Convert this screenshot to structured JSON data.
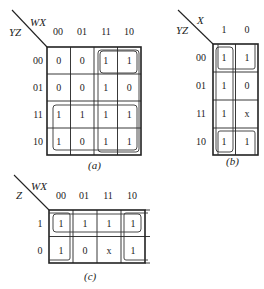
{
  "maps": {
    "a": {
      "caption": "(a)",
      "row_var": "YZ",
      "col_var": "WX",
      "col_labels": [
        "00",
        "01",
        "11",
        "10"
      ],
      "row_labels": [
        "00",
        "01",
        "11",
        "10"
      ],
      "cells": [
        [
          "0",
          "0",
          "1",
          "1"
        ],
        [
          "0",
          "0",
          "1",
          "0"
        ],
        [
          "1",
          "1",
          "1",
          "1"
        ],
        [
          "1",
          "0",
          "1",
          "1"
        ]
      ],
      "groups": [
        "rows 11-10 across all columns",
        "columns 11-10 rows 00 (top pair)",
        "column 11-10 rows 11-10 + column 11 rows 00-10"
      ]
    },
    "b": {
      "caption": "(b)",
      "row_var": "YZ",
      "col_var": "X",
      "col_labels": [
        "1",
        "0"
      ],
      "row_labels": [
        "00",
        "01",
        "11",
        "10"
      ],
      "cells": [
        [
          "1",
          "1"
        ],
        [
          "1",
          "0"
        ],
        [
          "1",
          "x"
        ],
        [
          "1",
          "1"
        ]
      ],
      "groups": [
        "column X=1 all rows",
        "row 00 both columns (wraps with row 10)",
        "row 10 both columns"
      ]
    },
    "c": {
      "caption": "(c)",
      "row_var": "Z",
      "col_var": "WX",
      "col_labels": [
        "00",
        "01",
        "11",
        "10"
      ],
      "row_labels": [
        "1",
        "0"
      ],
      "cells": [
        [
          "1",
          "1",
          "1",
          "1"
        ],
        [
          "1",
          "0",
          "x",
          "1"
        ]
      ],
      "groups": [
        "row Z=1 all columns",
        "column 00 both rows (wraps with column 10)",
        "column 10 both rows"
      ]
    }
  }
}
